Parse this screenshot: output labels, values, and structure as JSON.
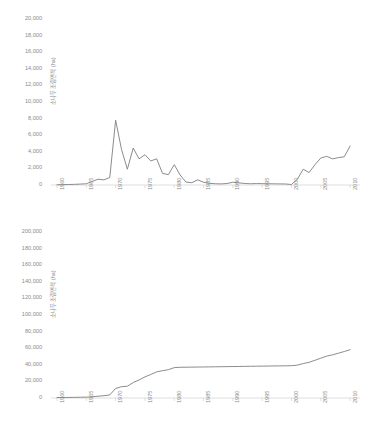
{
  "figure": {
    "background": "#ffffff",
    "line_color": "#7f7f7f",
    "axis_color": "#d6d6d6",
    "text_color": "#8a8a8a"
  },
  "chart_data": [
    {
      "type": "line",
      "id": "annual-afforestation-area",
      "title": "",
      "subtitle": "",
      "xlabel": "",
      "ylabel": "소나무 조림면적 (ha)",
      "xlim": [
        1960,
        2011
      ],
      "ylim": [
        0,
        20000
      ],
      "grid": false,
      "legend": "none",
      "ytick_labels": [
        "0",
        "2,000",
        "4,000",
        "6,000",
        "8,000",
        "10,000",
        "12,000",
        "14,000",
        "16,000",
        "18,000",
        "20,000"
      ],
      "ytick_values": [
        0,
        2000,
        4000,
        6000,
        8000,
        10000,
        12000,
        14000,
        16000,
        18000,
        20000
      ],
      "xtick_labels": [
        "1960",
        "1965",
        "1970",
        "1975",
        "1980",
        "1985",
        "1990",
        "1995",
        "2000",
        "2005",
        "2010"
      ],
      "xtick_values": [
        1960,
        1965,
        1970,
        1975,
        1980,
        1985,
        1990,
        1995,
        2000,
        2005,
        2010
      ],
      "x": [
        1960,
        1961,
        1962,
        1963,
        1964,
        1965,
        1966,
        1967,
        1968,
        1969,
        1970,
        1971,
        1972,
        1973,
        1974,
        1975,
        1976,
        1977,
        1978,
        1979,
        1980,
        1981,
        1982,
        1983,
        1984,
        1985,
        1986,
        1987,
        1988,
        1989,
        1990,
        1991,
        1992,
        1993,
        1994,
        1995,
        1996,
        1997,
        1998,
        1999,
        2000,
        2001,
        2002,
        2003,
        2004,
        2005,
        2006,
        2007,
        2008,
        2009,
        2010
      ],
      "values": [
        30,
        40,
        60,
        80,
        110,
        150,
        420,
        700,
        620,
        900,
        7800,
        4300,
        1900,
        4450,
        3150,
        3650,
        2900,
        3150,
        1400,
        1250,
        2450,
        1200,
        350,
        280,
        620,
        330,
        200,
        150,
        130,
        180,
        330,
        260,
        180,
        150,
        170,
        160,
        150,
        140,
        130,
        120,
        60,
        700,
        1900,
        1500,
        2450,
        3250,
        3450,
        3150,
        3300,
        3400,
        4700
      ]
    },
    {
      "type": "line",
      "id": "cumulative-afforestation-area",
      "title": "",
      "subtitle": "",
      "xlabel": "",
      "ylabel": "소나무 조림면적 (ha)",
      "xlim": [
        1960,
        2011
      ],
      "ylim": [
        0,
        200000
      ],
      "grid": false,
      "legend": "none",
      "ytick_labels": [
        "0",
        "20,000",
        "40,000",
        "60,000",
        "80,000",
        "100,000",
        "120,000",
        "140,000",
        "160,000",
        "180,000",
        "200,000"
      ],
      "ytick_values": [
        0,
        20000,
        40000,
        60000,
        80000,
        100000,
        120000,
        140000,
        160000,
        180000,
        200000
      ],
      "xtick_labels": [
        "1960",
        "1965",
        "1970",
        "1975",
        "1980",
        "1985",
        "1990",
        "1995",
        "2000",
        "2005",
        "2010"
      ],
      "xtick_values": [
        1960,
        1965,
        1970,
        1975,
        1980,
        1985,
        1990,
        1995,
        2000,
        2005,
        2010
      ],
      "x": [
        1960,
        1961,
        1962,
        1963,
        1964,
        1965,
        1966,
        1967,
        1968,
        1969,
        1970,
        1971,
        1972,
        1973,
        1974,
        1975,
        1976,
        1977,
        1978,
        1979,
        1980,
        1981,
        1982,
        1983,
        1984,
        1985,
        1986,
        1987,
        1988,
        1989,
        1990,
        1991,
        1992,
        1993,
        1994,
        1995,
        1996,
        1997,
        1998,
        1999,
        2000,
        2001,
        2002,
        2003,
        2004,
        2005,
        2006,
        2007,
        2008,
        2009,
        2010
      ],
      "values": [
        600,
        640,
        700,
        780,
        890,
        1040,
        1460,
        2160,
        2780,
        3680,
        11480,
        13600,
        14200,
        18650,
        21800,
        25450,
        28350,
        31500,
        32900,
        34150,
        36600,
        37000,
        37100,
        37200,
        37300,
        37400,
        37500,
        37600,
        37700,
        37800,
        37900,
        38000,
        38100,
        38200,
        38300,
        38400,
        38500,
        38600,
        38700,
        38800,
        38900,
        39600,
        41500,
        43000,
        45450,
        48000,
        50500,
        52000,
        54000,
        56000,
        58200
      ]
    }
  ]
}
